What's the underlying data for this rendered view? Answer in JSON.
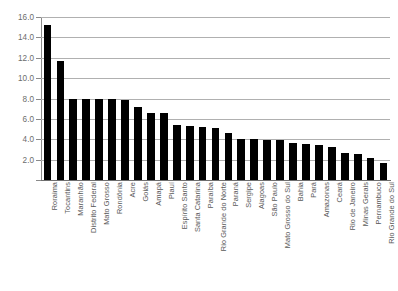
{
  "chart_data": {
    "type": "bar",
    "title": "",
    "subtitle": "",
    "xlabel": "",
    "ylabel": "",
    "ylim": [
      0,
      16
    ],
    "ytick_labels": [
      "16.0",
      "14.0",
      "12.0",
      "10.0",
      "8.0",
      "6.0",
      "4.0",
      "2.0"
    ],
    "ytick_values": [
      16.0,
      14.0,
      12.0,
      10.0,
      8.0,
      6.0,
      4.0,
      2.0
    ],
    "grid": true,
    "legend": null,
    "bar_color": "#000000",
    "categories": [
      "Roraima",
      "Tocantins",
      "Maranhão",
      "Distrito Federal",
      "Mato Grosso",
      "Rondônia",
      "Acre",
      "Goiás",
      "Amapá",
      "Piauí",
      "Espírito Santo",
      "Santa Catarina",
      "Paraíba",
      "Rio Grande do Norte",
      "Paraná",
      "Sergipe",
      "Alagoas",
      "São Paulo",
      "Mato Grosso do Sul",
      "Bahia",
      "Pará",
      "Amazonas",
      "Ceará",
      "Rio de Janeiro",
      "Minas Gerais",
      "Pernambuco",
      "Rio Grande do Sul"
    ],
    "values": [
      15.2,
      11.7,
      8.0,
      8.0,
      8.0,
      8.0,
      7.9,
      7.2,
      6.6,
      6.6,
      5.4,
      5.3,
      5.2,
      5.1,
      4.6,
      4.0,
      4.0,
      3.9,
      3.9,
      3.6,
      3.5,
      3.4,
      3.2,
      2.7,
      2.6,
      2.2,
      1.7
    ]
  }
}
